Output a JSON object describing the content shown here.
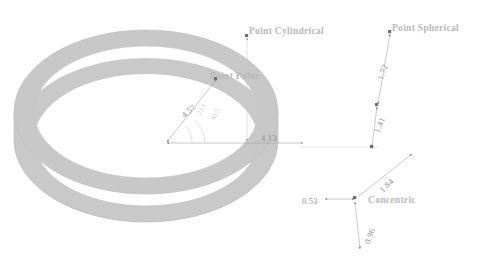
{
  "diagram": {
    "background_color": "#ffffff",
    "ring": {
      "name": "elliptical-ring",
      "fill_color": "#c8c8c8",
      "edge_color": "#bdbdbd",
      "center_x": 146,
      "center_y": 112,
      "outer_rx": 132,
      "outer_ry": 82,
      "inner_rx": 112,
      "inner_ry": 66,
      "extrude_depth": 28
    },
    "annotation_color": "#8e8e8e",
    "label_color": "#b9b9b9"
  },
  "callouts": [
    {
      "id": "point-cylindrical",
      "text": "Point Cylindrical",
      "x": 249,
      "y": 27
    },
    {
      "id": "point-polar",
      "text": "Point Polar",
      "x": 210,
      "y": 72
    },
    {
      "id": "point-spherical",
      "text": "Point Spherical",
      "x": 392,
      "y": 24
    },
    {
      "id": "concentric",
      "text": "Concentric",
      "x": 368,
      "y": 196
    }
  ],
  "dimensions": [
    {
      "id": "dim-radial-457",
      "value": "4.57",
      "x": 180,
      "y": 113,
      "rotate": "rot-n40",
      "style": "lbl-dim"
    },
    {
      "id": "dim-horiz-413",
      "value": "4.13",
      "x": 261,
      "y": 134,
      "rotate": "",
      "style": "lbl-dim"
    },
    {
      "id": "dim-vert-172",
      "value": "1.72",
      "x": 376,
      "y": 78,
      "rotate": "rot-n70",
      "style": "lbl-dim"
    },
    {
      "id": "dim-vert-141",
      "value": "1.41",
      "x": 373,
      "y": 131,
      "rotate": "rot-n70",
      "style": "lbl-dim"
    },
    {
      "id": "dim-horiz-053",
      "value": "0.53",
      "x": 302,
      "y": 197,
      "rotate": "",
      "style": "lbl-dim"
    },
    {
      "id": "dim-diag-184",
      "value": "1.84",
      "x": 378,
      "y": 188,
      "rotate": "rot-n45",
      "style": "lbl-dim"
    },
    {
      "id": "dim-vert-096",
      "value": "0.96",
      "x": 363,
      "y": 242,
      "rotate": "rot-n70",
      "style": "lbl-dim"
    }
  ],
  "angles": [
    {
      "id": "angle-a",
      "value": "23.1",
      "x": 196,
      "y": 113,
      "rotate": "rot-n63"
    },
    {
      "id": "angle-b",
      "value": "41.5",
      "x": 210,
      "y": 118,
      "rotate": "rot-n63"
    }
  ],
  "vertices": [
    {
      "id": "vertex-origin",
      "x": 165,
      "y": 143
    },
    {
      "id": "vertex-polar-point",
      "x": 216,
      "y": 79
    },
    {
      "id": "vertex-cylindrical-top",
      "x": 247,
      "y": 36
    },
    {
      "id": "vertex-horiz-end",
      "x": 303,
      "y": 143
    },
    {
      "id": "vertex-spherical-top",
      "x": 390,
      "y": 32
    },
    {
      "id": "vertex-spherical-mid",
      "x": 377,
      "y": 105
    },
    {
      "id": "vertex-spherical-base",
      "x": 372,
      "y": 148
    },
    {
      "id": "vertex-concentric",
      "x": 355,
      "y": 199
    },
    {
      "id": "vertex-diag-end",
      "x": 410,
      "y": 155
    }
  ]
}
